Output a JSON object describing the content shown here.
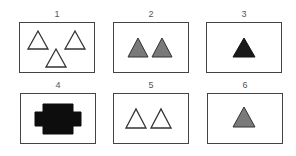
{
  "figure": {
    "panels": [
      {
        "label": "1",
        "shape": "triangle",
        "count": 3,
        "fill": "#ffffff",
        "stroke": "#333333",
        "description": "three outlined white triangles"
      },
      {
        "label": "2",
        "shape": "triangle",
        "count": 2,
        "fill": "#7a7a7a",
        "stroke": "#333333",
        "description": "two gray filled triangles"
      },
      {
        "label": "3",
        "shape": "triangle",
        "count": 1,
        "fill": "#1a1a1a",
        "stroke": "#111111",
        "description": "one black filled triangle"
      },
      {
        "label": "4",
        "shape": "blob",
        "count": 1,
        "fill": "#0d0d0d",
        "stroke": "#0d0d0d",
        "description": "one black cross-like blob shape"
      },
      {
        "label": "5",
        "shape": "triangle",
        "count": 2,
        "fill": "#ffffff",
        "stroke": "#333333",
        "description": "two outlined white triangles"
      },
      {
        "label": "6",
        "shape": "triangle",
        "count": 1,
        "fill": "#7a7a7a",
        "stroke": "#333333",
        "description": "one gray filled triangle"
      }
    ]
  },
  "colors": {
    "border": "#444444",
    "label": "#555555",
    "background": "#ffffff"
  }
}
